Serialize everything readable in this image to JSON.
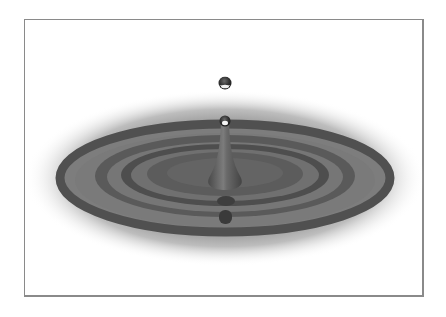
{
  "image": {
    "subject": "water droplet splash with concentric ripples",
    "style": "grayscale illustration",
    "elements": [
      "falling-droplet",
      "rebound-droplet",
      "water-column",
      "ripple-rings",
      "shadow-halo",
      "reflection-drops"
    ]
  },
  "colors": {
    "background": "#ffffff",
    "frame_border": "#8a8a8a",
    "ring_dark": "#505050",
    "ring_light": "#7a7a7a",
    "water_mid": "#626262",
    "halo": "#9a9a9a",
    "drop_dark": "#3a3a3a",
    "highlight": "#f4f4f4"
  }
}
